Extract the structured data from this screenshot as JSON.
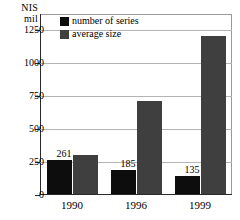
{
  "chart_data": {
    "type": "bar",
    "title": "",
    "xlabel": "",
    "ylabel": "NIS mil",
    "ylabel_lines": [
      "NIS",
      "mil"
    ],
    "categories": [
      "1990",
      "1996",
      "1999"
    ],
    "series": [
      {
        "name": "number of series",
        "color": "#0d0d0d",
        "values": [
          261,
          185,
          135
        ],
        "data_labels": [
          "261",
          "185",
          "135"
        ]
      },
      {
        "name": "average size",
        "color": "#3f3f3f",
        "values": [
          300,
          710,
          1200
        ],
        "data_labels": [
          "",
          "",
          ""
        ]
      }
    ],
    "ylim": [
      0,
      1375
    ],
    "yticks": [
      0,
      250,
      500,
      750,
      1000,
      1250
    ],
    "ytick_labels": [
      "0",
      "250",
      "500",
      "750",
      "1000",
      "1250"
    ],
    "grid": true,
    "legend_position": "top-left-inside"
  }
}
